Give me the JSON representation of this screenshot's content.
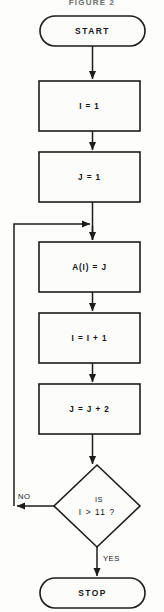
{
  "figure": {
    "title": "FIGURE 2",
    "title_clipped": true
  },
  "colors": {
    "background": "#fdfdfc",
    "line": "#1c1c1c",
    "shape_fill": "#fcfcfb",
    "text": "#141414"
  },
  "flowchart": {
    "start": {
      "label": "START"
    },
    "steps": [
      {
        "label": "I = 1"
      },
      {
        "label": "J = 1"
      },
      {
        "label": "A(I)  =  J"
      },
      {
        "label": "I = I + 1"
      },
      {
        "label": "J = J + 2"
      }
    ],
    "decision": {
      "line1": "IS",
      "line2": "I  >  11 ?"
    },
    "branches": {
      "no": "NO",
      "yes": "YES"
    },
    "stop": {
      "label": "STOP"
    }
  }
}
